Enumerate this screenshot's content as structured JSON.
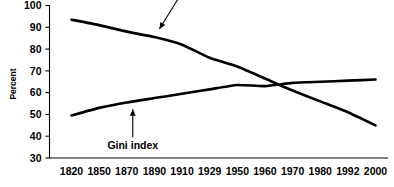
{
  "chart_data": {
    "type": "line",
    "title": "",
    "subtitle": "",
    "xlabel": "",
    "ylabel": "Percent",
    "ylim": [
      30,
      100
    ],
    "ytick_step": 10,
    "yticks": [
      100,
      90,
      80,
      70,
      60,
      50,
      40,
      30
    ],
    "grid": false,
    "legend_position": "inline-annotations",
    "categories": [
      "1820",
      "1850",
      "1870",
      "1890",
      "1910",
      "1929",
      "1950",
      "1960",
      "1970",
      "1980",
      "1992",
      "2000"
    ],
    "series": [
      {
        "name": "Poverty",
        "color": "#000000",
        "values": [
          93.5,
          91,
          88,
          85.5,
          82,
          76,
          72,
          66.5,
          61,
          56,
          51,
          45
        ]
      },
      {
        "name": "Gini index",
        "color": "#000000",
        "values": [
          49.5,
          53,
          55.5,
          57.5,
          59.5,
          61.5,
          63.5,
          63,
          64.5,
          65,
          65.5,
          66
        ]
      }
    ],
    "annotations": [
      {
        "text": "Poverty",
        "target_category": "1890",
        "target_value": 86,
        "arrow": "diagonal-down-left"
      },
      {
        "text": "Gini index",
        "target_category": "1870",
        "target_value": 56,
        "arrow": "vertical-up"
      }
    ]
  },
  "axis": {
    "y_label": "Percent"
  }
}
